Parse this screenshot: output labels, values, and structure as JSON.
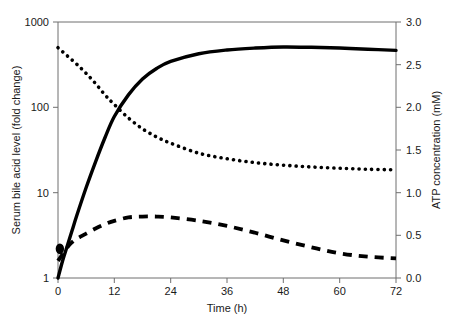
{
  "chart_data": {
    "type": "line",
    "title": "",
    "xlabel": "Time (h)",
    "ylabel": "Serum bile acid level (fold change)",
    "y2label": "ATP concentration (mM)",
    "xlim": [
      0,
      72
    ],
    "ylim": [
      1,
      1000
    ],
    "yscale": "log",
    "y2lim": [
      0,
      3.0
    ],
    "grid": false,
    "legend": "none",
    "xticks": [
      "0",
      "12",
      "24",
      "36",
      "48",
      "60",
      "72"
    ],
    "xtick_values": [
      0,
      12,
      24,
      36,
      48,
      60,
      72
    ],
    "yticks": [
      "1",
      "10",
      "100",
      "1000"
    ],
    "ytick_values": [
      1,
      10,
      100,
      1000
    ],
    "y2ticks": [
      "0.0",
      "0.5",
      "1.0",
      "1.5",
      "2.0",
      "2.5",
      "3.0"
    ],
    "y2tick_values": [
      0.0,
      0.5,
      1.0,
      1.5,
      2.0,
      2.5,
      3.0
    ],
    "series": [
      {
        "name": "Serum bile acid level (rising, solid)",
        "style": "solid",
        "axis": "left",
        "x": [
          0,
          1,
          2,
          3,
          4,
          6,
          8,
          10,
          12,
          15,
          18,
          21,
          24,
          30,
          36,
          42,
          48,
          54,
          60,
          66,
          72
        ],
        "values": [
          1.0,
          1.6,
          2.4,
          3.6,
          5.4,
          11.5,
          23.0,
          44.0,
          78.0,
          140.0,
          215.0,
          285.0,
          345.0,
          425.0,
          470.0,
          495.0,
          510.0,
          505.0,
          495.0,
          480.0,
          465.0
        ]
      },
      {
        "name": "Serum bile acid level (falling, dotted)",
        "style": "dotted",
        "axis": "left",
        "x": [
          0,
          2,
          4,
          6,
          8,
          10,
          12,
          15,
          18,
          21,
          24,
          30,
          36,
          42,
          48,
          54,
          60,
          66,
          72
        ],
        "values": [
          500.0,
          400.0,
          320.0,
          250.0,
          190.0,
          140.0,
          108.0,
          75.0,
          56.0,
          45.0,
          38.0,
          29.0,
          25.0,
          22.5,
          21.0,
          20.0,
          19.3,
          18.8,
          18.5
        ]
      },
      {
        "name": "ATP concentration (dashed)",
        "style": "dashed",
        "axis": "right",
        "x": [
          0,
          1,
          2,
          3,
          4,
          5,
          6,
          8,
          10,
          12,
          15,
          18,
          21,
          24,
          30,
          36,
          42,
          48,
          54,
          60,
          66,
          72
        ],
        "values": [
          0.2,
          0.28,
          0.36,
          0.42,
          0.46,
          0.49,
          0.52,
          0.58,
          0.63,
          0.67,
          0.71,
          0.72,
          0.72,
          0.71,
          0.67,
          0.61,
          0.53,
          0.44,
          0.36,
          0.29,
          0.25,
          0.23
        ]
      }
    ],
    "annotations": [
      {
        "name": "origin-marker",
        "x": 0.4,
        "y_left": 2.2,
        "description": "thick marker at curve origin"
      }
    ]
  }
}
